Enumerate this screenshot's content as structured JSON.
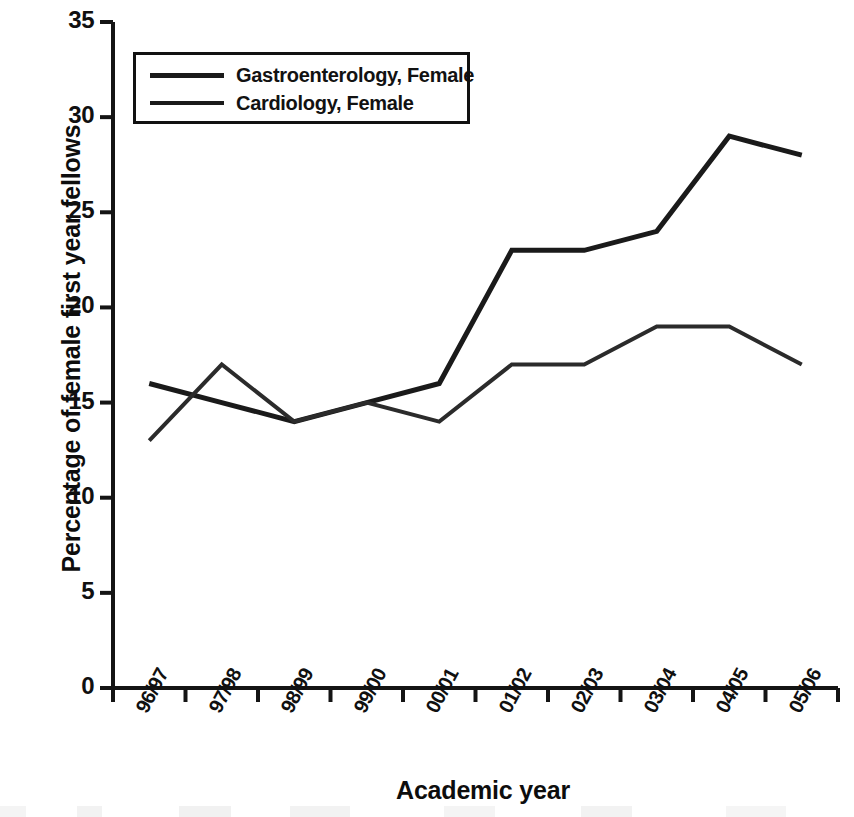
{
  "chart_data": {
    "type": "line",
    "title": "",
    "xlabel": "Academic year",
    "ylabel": "Percentage of female first year fellows",
    "categories": [
      "96/97",
      "97/98",
      "98/99",
      "99/00",
      "00/01",
      "01/02",
      "02/03",
      "03/04",
      "04/05",
      "05/06"
    ],
    "series": [
      {
        "name": "Gastroenterology, Female",
        "values": [
          16,
          15,
          14,
          15,
          16,
          23,
          23,
          24,
          29,
          28
        ],
        "color": "#1a1a1a",
        "line_width": 5
      },
      {
        "name": "Cardiology, Female",
        "values": [
          13,
          17,
          14,
          15,
          14,
          17,
          17,
          19,
          19,
          17
        ],
        "color": "#2b2b2b",
        "line_width": 4
      }
    ],
    "ylim": [
      0,
      35
    ],
    "ytick_values": [
      0,
      5,
      10,
      15,
      20,
      25,
      30,
      35
    ],
    "ytick_labels": [
      "0",
      "5",
      "10",
      "15",
      "20",
      "25",
      "30",
      "35"
    ],
    "grid": false,
    "legend_position": "top-left"
  },
  "axes": {
    "y_title": "Percentage of female first year fellows",
    "x_title": "Academic year"
  },
  "legend": {
    "entries": [
      {
        "label": "Gastroenterology, Female"
      },
      {
        "label": "Cardiology, Female"
      }
    ]
  }
}
